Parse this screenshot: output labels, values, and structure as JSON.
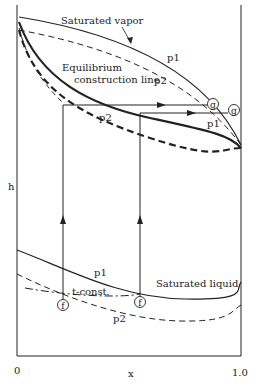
{
  "diagram": {
    "type": "enthalpy-composition diagram",
    "axes": {
      "y_label": "h",
      "x_label": "x",
      "x_ticks": [
        "0",
        "1.0"
      ]
    },
    "labels": {
      "saturated_vapor": "Saturated vapor",
      "equilibrium_line_1": "Equilibrium",
      "equilibrium_line_2": "construction line",
      "saturated_liquid": "Saturated liquid",
      "t_const": "t-const.",
      "vapor_p1": "p1",
      "vapor_p2": "p2",
      "equil_p2": "p2",
      "equil_p1": "p1",
      "liquid_p1": "p1",
      "liquid_p2": "p2",
      "g_marker": "g",
      "f_marker": "f"
    },
    "curves": [
      {
        "name": "saturated-vapor-p1",
        "style": "solid"
      },
      {
        "name": "saturated-vapor-p2",
        "style": "dashed"
      },
      {
        "name": "equilibrium-construction-p1",
        "style": "thick solid"
      },
      {
        "name": "equilibrium-construction-p2",
        "style": "thick dashed"
      },
      {
        "name": "saturated-liquid-p1",
        "style": "solid"
      },
      {
        "name": "saturated-liquid-p2",
        "style": "dashed"
      },
      {
        "name": "t-const",
        "style": "dash-dot"
      }
    ],
    "colors": {
      "ink": "#222222",
      "background": "#ffffff"
    }
  }
}
